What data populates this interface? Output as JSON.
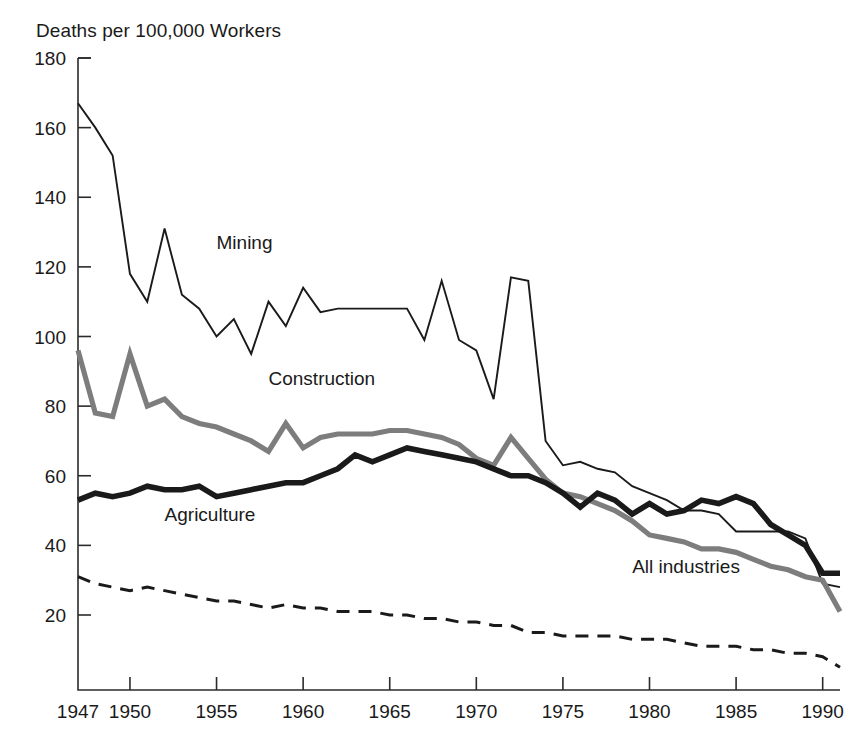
{
  "figure": {
    "y_axis_title": "Deaths per 100,000 Workers"
  },
  "chart_data": {
    "type": "line",
    "title": "Deaths per 100,000 Workers",
    "xlabel": "",
    "ylabel": "Deaths per 100,000 Workers",
    "xlim": [
      1947,
      1991
    ],
    "ylim": [
      0,
      180
    ],
    "grid": false,
    "legend_position": "inline-annotations",
    "x_tick_labels": [
      "1947",
      "1950",
      "1955",
      "1960",
      "1965",
      "1970",
      "1975",
      "1980",
      "1985",
      "1990"
    ],
    "x_ticks": [
      1947,
      1950,
      1955,
      1960,
      1965,
      1970,
      1975,
      1980,
      1985,
      1990
    ],
    "y_tick_labels": [
      "20",
      "40",
      "60",
      "80",
      "100",
      "120",
      "140",
      "160",
      "180"
    ],
    "y_ticks": [
      20,
      40,
      60,
      80,
      100,
      120,
      140,
      160,
      180
    ],
    "x": [
      1947,
      1948,
      1949,
      1950,
      1951,
      1952,
      1953,
      1954,
      1955,
      1956,
      1957,
      1958,
      1959,
      1960,
      1961,
      1962,
      1963,
      1964,
      1965,
      1966,
      1967,
      1968,
      1969,
      1970,
      1971,
      1972,
      1973,
      1974,
      1975,
      1976,
      1977,
      1978,
      1979,
      1980,
      1981,
      1982,
      1983,
      1984,
      1985,
      1986,
      1987,
      1988,
      1989,
      1990,
      1991
    ],
    "series": [
      {
        "name": "Mining",
        "color": "#1a1a1a",
        "style": "thin-solid",
        "label": "Mining",
        "values": [
          167,
          160,
          152,
          118,
          110,
          131,
          112,
          108,
          100,
          105,
          95,
          110,
          103,
          114,
          107,
          108,
          108,
          108,
          108,
          108,
          99,
          116,
          99,
          96,
          82,
          117,
          116,
          70,
          63,
          64,
          62,
          61,
          57,
          55,
          53,
          50,
          50,
          49,
          44,
          44,
          44,
          44,
          42,
          29,
          28
        ],
        "annotation_x": 1955,
        "annotation_y": 125
      },
      {
        "name": "Construction",
        "color": "#7d7d7d",
        "style": "thick-solid",
        "label": "Construction",
        "values": [
          96,
          78,
          77,
          95,
          80,
          82,
          77,
          75,
          74,
          72,
          70,
          67,
          75,
          68,
          71,
          72,
          72,
          72,
          73,
          73,
          72,
          71,
          69,
          65,
          63,
          71,
          65,
          59,
          55,
          54,
          52,
          50,
          47,
          43,
          42,
          41,
          39,
          39,
          38,
          36,
          34,
          33,
          31,
          30,
          21
        ],
        "annotation_x": 1958,
        "annotation_y": 86
      },
      {
        "name": "Agriculture",
        "color": "#1a1a1a",
        "style": "extra-thick-solid",
        "label": "Agriculture",
        "values": [
          53,
          55,
          54,
          55,
          57,
          56,
          56,
          57,
          54,
          55,
          56,
          57,
          58,
          58,
          60,
          62,
          66,
          64,
          66,
          68,
          67,
          66,
          65,
          64,
          62,
          60,
          60,
          58,
          55,
          51,
          55,
          53,
          49,
          52,
          49,
          50,
          53,
          52,
          54,
          52,
          46,
          43,
          40,
          32,
          32
        ],
        "annotation_x": 1952,
        "annotation_y": 47
      },
      {
        "name": "All industries",
        "color": "#1a1a1a",
        "style": "dashed",
        "label": "All industries",
        "values": [
          31,
          29,
          28,
          27,
          28,
          27,
          26,
          25,
          24,
          24,
          23,
          22,
          23,
          22,
          22,
          21,
          21,
          21,
          20,
          20,
          19,
          19,
          18,
          18,
          17,
          17,
          15,
          15,
          14,
          14,
          14,
          14,
          13,
          13,
          13,
          12,
          11,
          11,
          11,
          10,
          10,
          9,
          9,
          8,
          5
        ],
        "annotation_x": 1979,
        "annotation_y": 32
      }
    ]
  }
}
